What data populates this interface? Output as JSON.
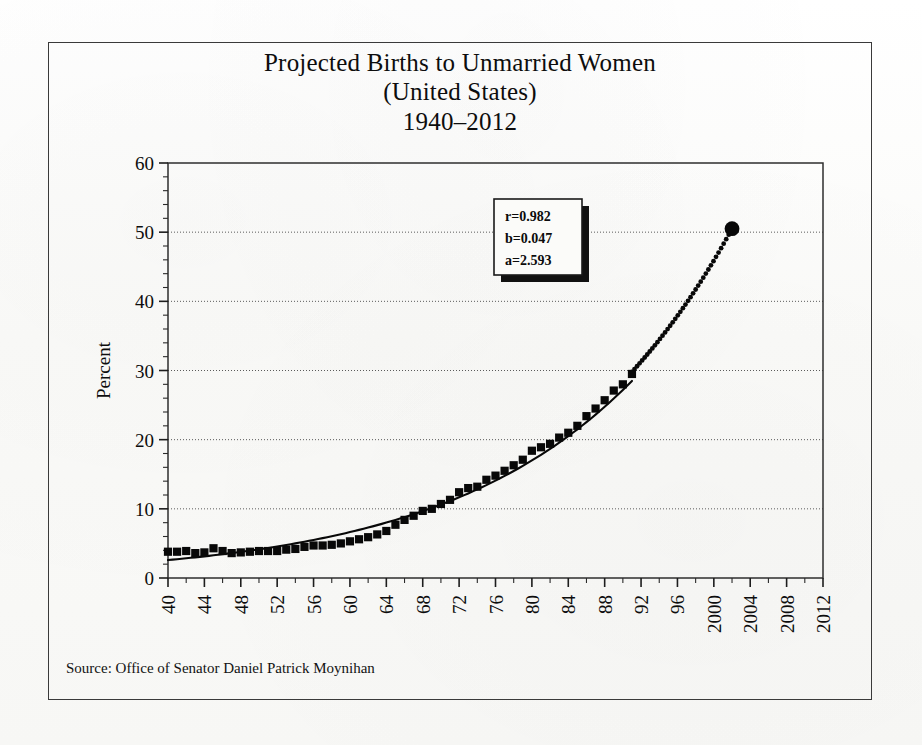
{
  "figure": {
    "title_lines": [
      "Projected Births to Unmarried Women",
      "(United States)",
      "1940–2012"
    ],
    "source_note": "Source: Office of Senator Daniel Patrick Moynihan"
  },
  "annotation": {
    "correlation_label": "r=0.982",
    "slope_label": "b=0.047",
    "intercept_label": "a=2.593"
  },
  "chart_data": {
    "type": "line",
    "title": "Projected Births to Unmarried Women (United States) 1940–2012",
    "xlabel": "",
    "ylabel": "Percent",
    "xlim": [
      1940,
      2012
    ],
    "ylim": [
      0,
      60
    ],
    "ytick_values": [
      0,
      10,
      20,
      30,
      40,
      50,
      60
    ],
    "ytick_labels": [
      "0",
      "10",
      "20",
      "30",
      "40",
      "50",
      "60"
    ],
    "y_minor_tick_step": 2,
    "grid": "horizontal-dotted",
    "legend": "none",
    "xtick_values": [
      1940,
      1944,
      1948,
      1952,
      1956,
      1960,
      1964,
      1968,
      1972,
      1976,
      1980,
      1984,
      1988,
      1992,
      1996,
      2000,
      2004,
      2008,
      2012
    ],
    "xtick_labels": [
      "40",
      "44",
      "48",
      "52",
      "56",
      "60",
      "64",
      "68",
      "72",
      "76",
      "80",
      "84",
      "88",
      "92",
      "96",
      "2000",
      "2004",
      "2008",
      "2012"
    ],
    "xtick_rotation": 90,
    "fit_equation": "y = 2.593 * exp(0.047 * (year - 1940))",
    "fit_r": 0.982,
    "fit_b": 0.047,
    "fit_a": 2.593,
    "series": [
      {
        "name": "Observed percent of births to unmarried women",
        "marker": "square",
        "style": "markers",
        "x": [
          1940,
          1941,
          1942,
          1943,
          1944,
          1945,
          1946,
          1947,
          1948,
          1949,
          1950,
          1951,
          1952,
          1953,
          1954,
          1955,
          1956,
          1957,
          1958,
          1959,
          1960,
          1961,
          1962,
          1963,
          1964,
          1965,
          1966,
          1967,
          1968,
          1969,
          1970,
          1971,
          1972,
          1973,
          1974,
          1975,
          1976,
          1977,
          1978,
          1979,
          1980,
          1981,
          1982,
          1983,
          1984,
          1985,
          1986,
          1987,
          1988,
          1989,
          1990,
          1991
        ],
        "values": [
          3.8,
          3.8,
          3.9,
          3.6,
          3.7,
          4.3,
          3.9,
          3.6,
          3.7,
          3.8,
          3.9,
          3.9,
          3.9,
          4.1,
          4.2,
          4.5,
          4.7,
          4.7,
          4.8,
          5.0,
          5.3,
          5.6,
          5.9,
          6.3,
          6.8,
          7.7,
          8.4,
          9.0,
          9.7,
          10.0,
          10.7,
          11.3,
          12.4,
          13.0,
          13.2,
          14.2,
          14.8,
          15.5,
          16.3,
          17.1,
          18.4,
          18.9,
          19.4,
          20.3,
          21.0,
          22.0,
          23.4,
          24.5,
          25.7,
          27.1,
          28.0,
          29.5
        ]
      },
      {
        "name": "Exponential trend fit",
        "style": "solid-line",
        "x": [
          1940,
          1950,
          1960,
          1970,
          1980,
          1991
        ],
        "values": [
          2.6,
          4.2,
          6.7,
          10.7,
          17.1,
          28.7
        ]
      },
      {
        "name": "Projection",
        "style": "dotted-line",
        "x": [
          1991,
          1994,
          1997,
          2000,
          2002
        ],
        "values": [
          29.8,
          34.0,
          39.8,
          46.0,
          50.5
        ]
      },
      {
        "name": "Projected endpoint",
        "style": "single-marker",
        "marker": "circle",
        "x": [
          2002
        ],
        "values": [
          50.5
        ]
      }
    ]
  }
}
